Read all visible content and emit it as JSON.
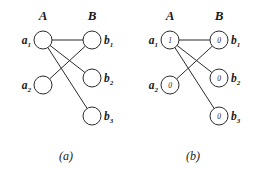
{
  "figure": {
    "background_color": "#ffffff",
    "ink_color": "#2b2b2b",
    "panels": [
      {
        "id": "a",
        "caption": "(a)",
        "column_headers": {
          "left": "A",
          "right": "B"
        },
        "show_node_values": false,
        "nodes": [
          {
            "id": "a1",
            "label": "a",
            "subscript": "1",
            "side": "left",
            "cx": 43,
            "cy": 40,
            "r": 9,
            "value": ""
          },
          {
            "id": "a2",
            "label": "a",
            "subscript": "2",
            "side": "left",
            "cx": 43,
            "cy": 85,
            "r": 9,
            "value": ""
          },
          {
            "id": "b1",
            "label": "b",
            "subscript": "1",
            "side": "right",
            "cx": 92,
            "cy": 40,
            "r": 9,
            "value": ""
          },
          {
            "id": "b2",
            "label": "b",
            "subscript": "2",
            "side": "right",
            "cx": 92,
            "cy": 78,
            "r": 9,
            "value": ""
          },
          {
            "id": "b3",
            "label": "b",
            "subscript": "3",
            "side": "right",
            "cx": 92,
            "cy": 116,
            "r": 9,
            "value": ""
          }
        ],
        "edges": [
          {
            "from": "a1",
            "to": "b1"
          },
          {
            "from": "a1",
            "to": "b2"
          },
          {
            "from": "a1",
            "to": "b3"
          },
          {
            "from": "a2",
            "to": "b1"
          }
        ]
      },
      {
        "id": "b",
        "caption": "(b)",
        "column_headers": {
          "left": "A",
          "right": "B"
        },
        "show_node_values": true,
        "nodes": [
          {
            "id": "a1",
            "label": "a",
            "subscript": "1",
            "side": "left",
            "cx": 43,
            "cy": 40,
            "r": 9,
            "value": "1"
          },
          {
            "id": "a2",
            "label": "a",
            "subscript": "2",
            "side": "left",
            "cx": 43,
            "cy": 85,
            "r": 9,
            "value": "0"
          },
          {
            "id": "b1",
            "label": "b",
            "subscript": "1",
            "side": "right",
            "cx": 92,
            "cy": 40,
            "r": 9,
            "value": "0"
          },
          {
            "id": "b2",
            "label": "b",
            "subscript": "2",
            "side": "right",
            "cx": 92,
            "cy": 78,
            "r": 9,
            "value": "0"
          },
          {
            "id": "b3",
            "label": "b",
            "subscript": "3",
            "side": "right",
            "cx": 92,
            "cy": 116,
            "r": 9,
            "value": "0"
          }
        ],
        "edges": [
          {
            "from": "a1",
            "to": "b1"
          },
          {
            "from": "a1",
            "to": "b2"
          },
          {
            "from": "a1",
            "to": "b3"
          },
          {
            "from": "a2",
            "to": "b1"
          }
        ]
      }
    ],
    "header_y": 20,
    "header_left_x": 43,
    "header_right_x": 92,
    "caption_y": 160,
    "caption_x": 66
  }
}
